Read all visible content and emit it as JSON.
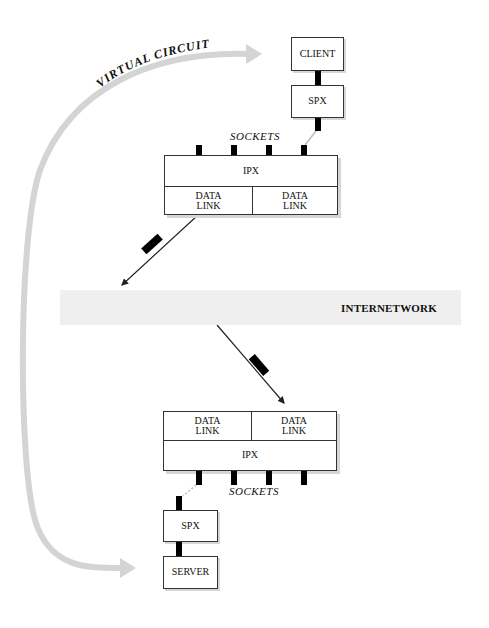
{
  "diagram": {
    "virtual_circuit_label": "VIRTUAL CIRCUIT",
    "internetwork_label": "INTERNETWORK",
    "client_node": {
      "app_label": "CLIENT",
      "spx_label": "SPX",
      "sockets_label": "SOCKETS",
      "ipx_label": "IPX",
      "data_links": [
        "DATA\nLINK",
        "DATA\nLINK"
      ]
    },
    "server_node": {
      "app_label": "SERVER",
      "spx_label": "SPX",
      "sockets_label": "SOCKETS",
      "ipx_label": "IPX",
      "data_links": [
        "DATA\nLINK",
        "DATA\nLINK"
      ]
    },
    "colors": {
      "arc": "#d4d4d4",
      "band": "#efefef",
      "line": "#333333",
      "packet": "#000000"
    }
  }
}
